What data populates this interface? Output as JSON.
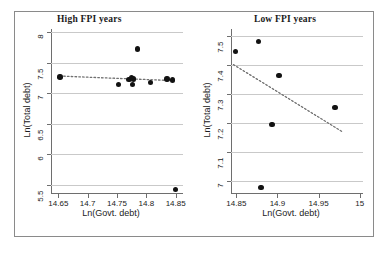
{
  "figure": {
    "background_color": "#ffffff",
    "point_color": "#121212",
    "grid_color": "#c9c9c9",
    "axis_color": "#6e6e6e",
    "border_color": "#8a8a8a"
  },
  "chart_data": [
    {
      "type": "scatter",
      "title": "High FPI years",
      "xlabel": "Ln(Govt. debt)",
      "ylabel": "Ln(Total debt)",
      "xlim": [
        14.6375,
        14.8625
      ],
      "ylim": [
        5.35,
        8.05
      ],
      "xticks": [
        "14.65",
        "14.7",
        "14.75",
        "14.8",
        "14.85"
      ],
      "xtick_values": [
        14.65,
        14.7,
        14.75,
        14.8,
        14.85
      ],
      "yticks": [
        "5.5",
        "6",
        "6.5",
        "7",
        "7.5",
        "8"
      ],
      "ytick_values": [
        5.5,
        6,
        6.5,
        7,
        7.5,
        8
      ],
      "grid": "horizontal",
      "legend": "none",
      "points": [
        {
          "x": 14.6525,
          "y": 7.265
        },
        {
          "x": 14.7525,
          "y": 7.145
        },
        {
          "x": 14.7705,
          "y": 7.225
        },
        {
          "x": 14.7745,
          "y": 7.255
        },
        {
          "x": 14.7765,
          "y": 7.145
        },
        {
          "x": 14.7785,
          "y": 7.235
        },
        {
          "x": 14.7845,
          "y": 7.72
        },
        {
          "x": 14.8075,
          "y": 7.175
        },
        {
          "x": 14.8355,
          "y": 7.235
        },
        {
          "x": 14.8445,
          "y": 7.215
        },
        {
          "x": 14.8495,
          "y": 5.42
        }
      ],
      "trendline": {
        "style": "dotted",
        "x_start": 14.6525,
        "y_start": 7.28,
        "x_end": 14.847,
        "y_end": 7.205
      }
    },
    {
      "type": "scatter",
      "title": "Low FPI years",
      "xlabel": "Ln(Govt. debt)",
      "ylabel": "Ln(Total debt)",
      "xlim": [
        14.8435,
        15.004
      ],
      "ylim": [
        6.955,
        7.525
      ],
      "xticks": [
        "14.85",
        "14.9",
        "14.95",
        "15"
      ],
      "xtick_values": [
        14.85,
        14.9,
        14.95,
        15.0
      ],
      "yticks": [
        "7",
        "7.1",
        "7.2",
        "7.3",
        "7.4",
        "7.5"
      ],
      "ytick_values": [
        7.0,
        7.1,
        7.2,
        7.3,
        7.4,
        7.5
      ],
      "grid": "horizontal",
      "legend": "none",
      "points": [
        {
          "x": 14.849,
          "y": 7.447
        },
        {
          "x": 14.877,
          "y": 7.482
        },
        {
          "x": 14.88,
          "y": 6.977
        },
        {
          "x": 14.8935,
          "y": 7.196
        },
        {
          "x": 14.902,
          "y": 7.365
        },
        {
          "x": 14.97,
          "y": 7.253
        }
      ],
      "trendline": {
        "style": "dotted",
        "x_start": 14.8465,
        "y_start": 7.402,
        "x_end": 14.98,
        "y_end": 7.168
      }
    }
  ]
}
